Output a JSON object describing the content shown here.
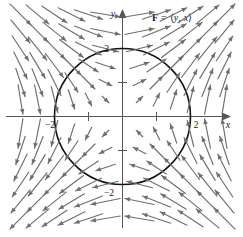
{
  "figure": {
    "title_label": "F = ⟨y, x⟩",
    "label_parts": {
      "vector_name": "F",
      "equals": " = ⟨",
      "first_component": "y",
      "separator": ", ",
      "second_component": "x",
      "close": "⟩"
    },
    "background_color": "#ffffff",
    "arrow_color": "#6e6e6e",
    "curve_color": "#111111",
    "axis_color": "#555555"
  },
  "axes": {
    "x_axis_name": "x",
    "y_axis_name": "y",
    "x_ticks": [
      {
        "value": -2,
        "label": "−2"
      },
      {
        "value": -1,
        "label": ""
      },
      {
        "value": 1,
        "label": ""
      },
      {
        "value": 2,
        "label": "2"
      }
    ],
    "y_ticks": [
      {
        "value": -2,
        "label": "−2"
      },
      {
        "value": -1,
        "label": ""
      },
      {
        "value": 1,
        "label": ""
      },
      {
        "value": 2,
        "label": "2"
      }
    ]
  },
  "chart_data": {
    "type": "scatter",
    "title": "F = ⟨y, x⟩",
    "xlabel": "x",
    "ylabel": "y",
    "xlim": [
      -3.4,
      3.4
    ],
    "ylim": [
      -3.3,
      3.3
    ],
    "grid": false,
    "legend": null,
    "plot_kind": "vector-field-with-circle",
    "field_formula": {
      "u": "y",
      "v": "x"
    },
    "overlay_curve": {
      "kind": "circle",
      "center": [
        0,
        0
      ],
      "radius": 2,
      "equation": "x^2 + y^2 = 4"
    },
    "sample_grid": {
      "x_values": [
        -3,
        -2.5,
        -2,
        -1.5,
        -1,
        -0.5,
        0.5,
        1,
        1.5,
        2,
        2.5,
        3
      ],
      "y_values": [
        -3,
        -2.5,
        -2,
        -1.5,
        -1,
        -0.5,
        0.5,
        1,
        1.5,
        2,
        2.5,
        3
      ],
      "note": "Arrow at each (x,y) points along (y, x); length scales with magnitude."
    },
    "annotations": [
      {
        "text": "F = ⟨y, x⟩",
        "x": 1.55,
        "y": 2.85
      },
      {
        "text": "2",
        "x": -0.28,
        "y": 2.0
      },
      {
        "text": "2",
        "x": 2.12,
        "y": -0.32
      },
      {
        "text": "−2",
        "x": -2.05,
        "y": -0.34
      },
      {
        "text": "−2",
        "x": -0.38,
        "y": -2.05
      }
    ]
  }
}
